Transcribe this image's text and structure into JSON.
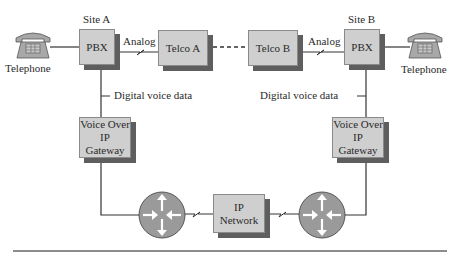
{
  "diagram": {
    "site_a": {
      "label": "Site A",
      "telephone_label": "Telephone",
      "pbx_label": "PBX",
      "analog_label": "Analog",
      "telco_label": "Telco A",
      "digital_label": "Digital voice data",
      "gateway_line1": "Voice Over",
      "gateway_line2": "IP Gateway"
    },
    "site_b": {
      "label": "Site B",
      "telephone_label": "Telephone",
      "pbx_label": "PBX",
      "analog_label": "Analog",
      "telco_label": "Telco B",
      "digital_label": "Digital voice data",
      "gateway_line1": "Voice Over",
      "gateway_line2": "IP Gateway"
    },
    "ip_network": {
      "line1": "IP",
      "line2": "Network"
    },
    "colors": {
      "box_front": "#cfcfcf",
      "box_shadow": "#5e5e5e",
      "router_fill": "#9a9a9a",
      "line": "#333333"
    }
  }
}
